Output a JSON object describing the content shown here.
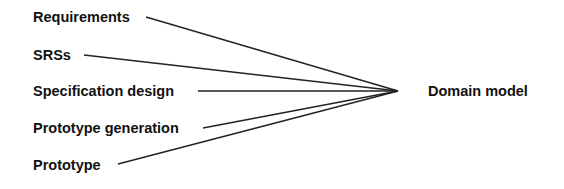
{
  "diagram": {
    "sources": [
      {
        "id": "requirements",
        "label": "Requirements",
        "x": 33,
        "y": 10,
        "line_start": [
          146,
          17
        ]
      },
      {
        "id": "srss",
        "label": "SRSs",
        "x": 33,
        "y": 48,
        "line_start": [
          84,
          55
        ]
      },
      {
        "id": "specification-design",
        "label": "Specification design",
        "x": 33,
        "y": 84,
        "line_start": [
          198,
          91
        ]
      },
      {
        "id": "prototype-generation",
        "label": "Prototype generation",
        "x": 33,
        "y": 121,
        "line_start": [
          203,
          128
        ]
      },
      {
        "id": "prototype",
        "label": "Prototype",
        "x": 33,
        "y": 158,
        "line_start": [
          118,
          164
        ]
      }
    ],
    "target": {
      "id": "domain-model",
      "label": "Domain model",
      "x": 428,
      "y": 84,
      "point": [
        398,
        91
      ]
    },
    "line_color": "#222222"
  }
}
